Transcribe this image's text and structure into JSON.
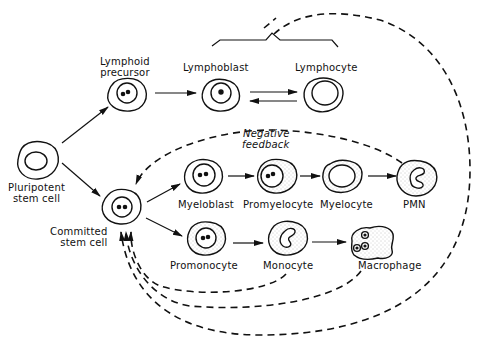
{
  "diagram": {
    "type": "hematopoiesis-lineage",
    "nodes": [
      {
        "id": "pluripotent",
        "label_line1": "Pluripotent",
        "label_line2": "stem cell"
      },
      {
        "id": "lymphoid",
        "label_line1": "Lymphoid",
        "label_line2": "precursor"
      },
      {
        "id": "lymphoblast",
        "label": "Lymphoblast"
      },
      {
        "id": "lymphocyte",
        "label": "Lymphocyte"
      },
      {
        "id": "committed",
        "label_line1": "Committed",
        "label_line2": "stem cell"
      },
      {
        "id": "myeloblast",
        "label": "Myeloblast"
      },
      {
        "id": "promyelocyte",
        "label": "Promyelocyte"
      },
      {
        "id": "myelocyte",
        "label": "Myelocyte"
      },
      {
        "id": "pmn",
        "label": "PMN"
      },
      {
        "id": "promonocyte",
        "label": "Promonocyte"
      },
      {
        "id": "monocyte",
        "label": "Monocyte"
      },
      {
        "id": "macrophage",
        "label": "Macrophage"
      }
    ],
    "edges": [
      {
        "from": "pluripotent",
        "to": "lymphoid",
        "style": "solid"
      },
      {
        "from": "pluripotent",
        "to": "committed",
        "style": "solid"
      },
      {
        "from": "lymphoid",
        "to": "lymphoblast",
        "style": "solid"
      },
      {
        "from": "lymphoblast",
        "to": "lymphocyte",
        "style": "solid-bidirectional"
      },
      {
        "from": "committed",
        "to": "myeloblast",
        "style": "solid"
      },
      {
        "from": "committed",
        "to": "promonocyte",
        "style": "solid"
      },
      {
        "from": "myeloblast",
        "to": "promyelocyte",
        "style": "solid"
      },
      {
        "from": "promyelocyte",
        "to": "myelocyte",
        "style": "solid"
      },
      {
        "from": "myelocyte",
        "to": "pmn",
        "style": "solid"
      },
      {
        "from": "promonocyte",
        "to": "monocyte",
        "style": "solid"
      },
      {
        "from": "monocyte",
        "to": "macrophage",
        "style": "solid"
      },
      {
        "from": "pmn",
        "to": "committed",
        "style": "dashed"
      },
      {
        "from": "monocyte",
        "to": "committed",
        "style": "dashed"
      },
      {
        "from": "macrophage",
        "to": "committed",
        "style": "dashed"
      },
      {
        "from": "lymphoblast-lymphocyte-group",
        "to": "committed",
        "style": "dashed"
      }
    ],
    "annotation": {
      "line1": "Negative",
      "line2": "feedback"
    }
  }
}
